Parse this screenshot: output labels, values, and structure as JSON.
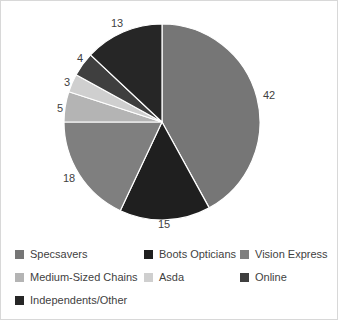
{
  "chart_data": {
    "type": "pie",
    "title": "",
    "xlabel": "",
    "ylabel": "",
    "legend_position": "bottom",
    "grid": false,
    "categories": [
      "Specsavers",
      "Boots Opticians",
      "Vision Express",
      "Medium-Sized Chains",
      "Asda",
      "Online",
      "Independents/Other"
    ],
    "values": [
      42,
      15,
      18,
      5,
      3,
      4,
      13
    ],
    "labels": [
      "42",
      "15",
      "18",
      "5",
      "3",
      "4",
      "13"
    ],
    "colors": [
      "#767676",
      "#1f1f1f",
      "#7f7f7f",
      "#b4b4b4",
      "#cfcfcf",
      "#3f3f3f",
      "#262626"
    ],
    "slice_order_clockwise_from_top": [
      "Specsavers",
      "Boots Opticians",
      "Vision Express",
      "Medium-Sized Chains",
      "Asda",
      "Online",
      "Independents/Other"
    ]
  },
  "legend": {
    "rows": [
      [
        {
          "label": "Specsavers",
          "color": "#767676"
        },
        {
          "label": "Boots Opticians",
          "color": "#1f1f1f"
        },
        {
          "label": "Vision Express",
          "color": "#7f7f7f"
        }
      ],
      [
        {
          "label": "Medium-Sized Chains",
          "color": "#b4b4b4"
        },
        {
          "label": "Asda",
          "color": "#cfcfcf"
        },
        {
          "label": "Online",
          "color": "#3f3f3f"
        }
      ],
      [
        {
          "label": "Independents/Other",
          "color": "#262626"
        }
      ]
    ]
  },
  "data_labels": [
    {
      "text": "42",
      "x": 262,
      "y": 89
    },
    {
      "text": "15",
      "x": 157,
      "y": 218
    },
    {
      "text": "18",
      "x": 62,
      "y": 172
    },
    {
      "text": "5",
      "x": 56,
      "y": 102
    },
    {
      "text": "3",
      "x": 63,
      "y": 76
    },
    {
      "text": "4",
      "x": 76,
      "y": 52
    },
    {
      "text": "13",
      "x": 110,
      "y": 17
    }
  ]
}
